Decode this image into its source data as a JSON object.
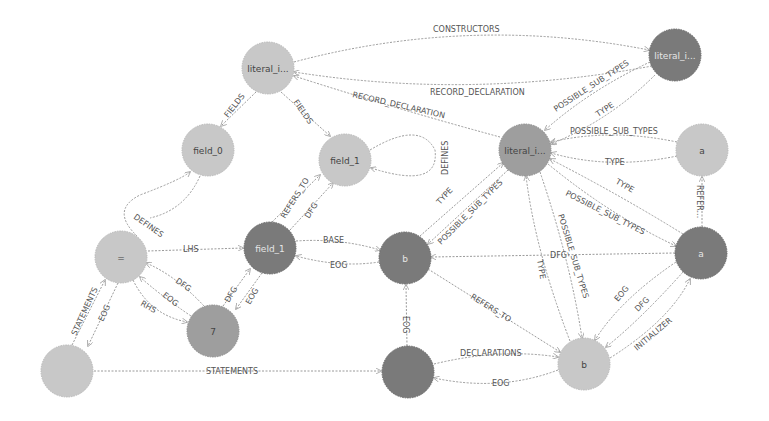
{
  "graph": {
    "nodes": {
      "literal_top_left": {
        "label": "literal_i...",
        "x": 268,
        "y": 68,
        "r": 26,
        "shade": "light"
      },
      "literal_top_right": {
        "label": "literal_i...",
        "x": 675,
        "y": 55,
        "r": 26,
        "shade": "dark"
      },
      "literal_center": {
        "label": "literal_i...",
        "x": 525,
        "y": 150,
        "r": 26,
        "shade": "mid"
      },
      "field_0": {
        "label": "field_0",
        "x": 208,
        "y": 150,
        "r": 26,
        "shade": "light"
      },
      "field_1_top": {
        "label": "field_1",
        "x": 345,
        "y": 160,
        "r": 26,
        "shade": "light"
      },
      "a_top": {
        "label": "a",
        "x": 702,
        "y": 150,
        "r": 26,
        "shade": "light"
      },
      "assign": {
        "label": "=",
        "x": 121,
        "y": 257,
        "r": 26,
        "shade": "light"
      },
      "field_1_mid": {
        "label": "field_1",
        "x": 270,
        "y": 248,
        "r": 26,
        "shade": "dark"
      },
      "b_mid": {
        "label": "b",
        "x": 405,
        "y": 258,
        "r": 26,
        "shade": "dark"
      },
      "a_right": {
        "label": "a",
        "x": 701,
        "y": 253,
        "r": 26,
        "shade": "dark"
      },
      "seven": {
        "label": "7",
        "x": 213,
        "y": 331,
        "r": 26,
        "shade": "mid"
      },
      "root": {
        "label": "",
        "x": 67,
        "y": 371,
        "r": 26,
        "shade": "light"
      },
      "decl": {
        "label": "",
        "x": 408,
        "y": 372,
        "r": 26,
        "shade": "dark"
      },
      "b_bottom": {
        "label": "b",
        "x": 584,
        "y": 364,
        "r": 26,
        "shade": "light"
      }
    },
    "edges": [
      {
        "label": "CONSTRUCTORS"
      },
      {
        "label": "RECORD_DECLARATION"
      },
      {
        "label": "RECORD_DECLARATION"
      },
      {
        "label": "FIELDS"
      },
      {
        "label": "FIELDS"
      },
      {
        "label": "POSSIBLE_SUB_TYPES"
      },
      {
        "label": "TYPE"
      },
      {
        "label": "POSSIBLE_SUB_TYPES"
      },
      {
        "label": "TYPE"
      },
      {
        "label": "DEFINES"
      },
      {
        "label": "DEFINES"
      },
      {
        "label": "REFERS_TO"
      },
      {
        "label": "DFG"
      },
      {
        "label": "TYPE"
      },
      {
        "label": "POSSIBLE_SUB_TYPES"
      },
      {
        "label": "TYPE"
      },
      {
        "label": "POSSIBLE_SUB_TYPES"
      },
      {
        "label": "REFER..."
      },
      {
        "label": "LHS"
      },
      {
        "label": "BASE"
      },
      {
        "label": "EOG"
      },
      {
        "label": "DFG"
      },
      {
        "label": "EOG"
      },
      {
        "label": "RHS"
      },
      {
        "label": "DFG"
      },
      {
        "label": "EOG"
      },
      {
        "label": "DFG"
      },
      {
        "label": "TYPE"
      },
      {
        "label": "POSSIBLE_SUB_TYPES"
      },
      {
        "label": "REFERS_TO"
      },
      {
        "label": "EOG"
      },
      {
        "label": "EOG"
      },
      {
        "label": "DFG"
      },
      {
        "label": "INITIALIZER"
      },
      {
        "label": "STATEMENTS"
      },
      {
        "label": "EOG"
      },
      {
        "label": "STATEMENTS"
      },
      {
        "label": "DECLARATIONS"
      },
      {
        "label": "EOG"
      }
    ]
  },
  "colors": {
    "node_light": "#c8c8c8",
    "node_mid": "#9e9e9e",
    "node_dark": "#7a7a7a",
    "edge": "#9a9a9a",
    "label": "#555555",
    "background": "#ffffff"
  }
}
